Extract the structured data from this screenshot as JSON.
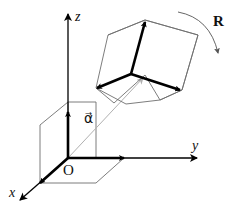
{
  "diagram": {
    "axes": {
      "z_label": "z",
      "y_label": "y",
      "x_label": "x",
      "origin_label": "O"
    },
    "translation_vector_label": "α⃗",
    "rotation_label": "R",
    "colors": {
      "axis": "#000000",
      "frame_edges": "#6e6e6e",
      "vector_alpha": "#b0b0b0",
      "background": "#ffffff"
    }
  }
}
